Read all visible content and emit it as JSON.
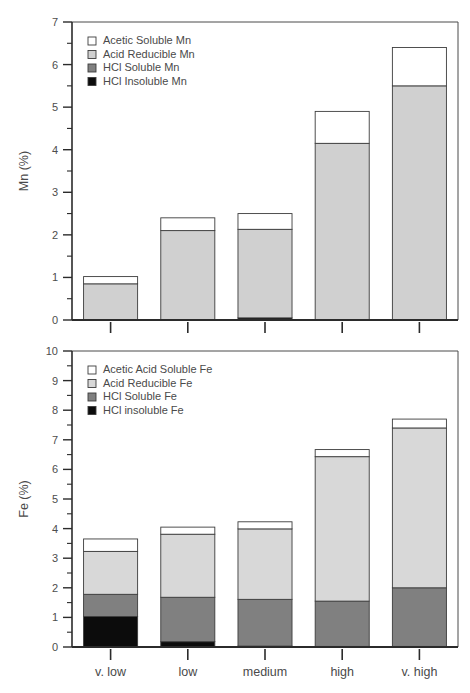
{
  "figure": {
    "background": "#ffffff",
    "categories": [
      "v. low",
      "low",
      "medium",
      "high",
      "v. high"
    ]
  },
  "colors": {
    "acetic": "#ffffff",
    "reducible_mn": "#d0d0d0",
    "reducible_fe": "#d8d8d8",
    "hcl_soluble": "#808080",
    "hcl_insoluble": "#0c0c0c",
    "outline": "#3c3c3c",
    "axis": "#2b2b2b",
    "text": "#4a4a4a"
  },
  "chart_data": [
    {
      "id": "mn-panel",
      "type": "bar",
      "stacked": true,
      "title": "",
      "xlabel": "",
      "ylabel": "Mn (%)",
      "ylim": [
        0,
        7
      ],
      "yticks": [
        0,
        1,
        2,
        3,
        4,
        5,
        6,
        7
      ],
      "ytick_labels": [
        "0",
        "1",
        "2",
        "3",
        "4",
        "5",
        "6",
        "7"
      ],
      "minor_tick_step": 0.5,
      "grid": false,
      "legend_position": "upper left",
      "categories": [
        "v. low",
        "low",
        "medium",
        "high",
        "v. high"
      ],
      "series": [
        {
          "name": "HCl Insoluble Mn",
          "key": "hcl_insoluble",
          "color": "#0c0c0c",
          "values": [
            0,
            0,
            0.05,
            0,
            0
          ]
        },
        {
          "name": "HCl Soluble Mn",
          "key": "hcl_soluble",
          "color": "#808080",
          "values": [
            0,
            0,
            0,
            0,
            0
          ]
        },
        {
          "name": "Acid Reducible Mn",
          "key": "reducible_mn",
          "color": "#d0d0d0",
          "values": [
            0.85,
            2.1,
            2.08,
            4.15,
            5.5
          ]
        },
        {
          "name": "Acetic Soluble Mn",
          "key": "acetic",
          "color": "#ffffff",
          "values": [
            0.17,
            0.3,
            0.37,
            0.75,
            0.9
          ]
        }
      ],
      "totals": [
        1.02,
        2.4,
        2.5,
        4.9,
        6.4
      ],
      "legend": [
        {
          "label": "Acetic Soluble Mn",
          "color": "#ffffff"
        },
        {
          "label": "Acid Reducible Mn",
          "color": "#d0d0d0"
        },
        {
          "label": "HCl Soluble Mn",
          "color": "#808080"
        },
        {
          "label": "HCl Insoluble Mn",
          "color": "#0c0c0c"
        }
      ]
    },
    {
      "id": "fe-panel",
      "type": "bar",
      "stacked": true,
      "title": "",
      "xlabel": "",
      "ylabel": "Fe (%)",
      "ylim": [
        0,
        10
      ],
      "yticks": [
        0,
        1,
        2,
        3,
        4,
        5,
        6,
        7,
        8,
        9,
        10
      ],
      "ytick_labels": [
        "0",
        "1",
        "2",
        "3",
        "4",
        "5",
        "6",
        "7",
        "8",
        "9",
        "10"
      ],
      "minor_tick_step": 0.5,
      "grid": false,
      "legend_position": "upper left",
      "categories": [
        "v. low",
        "low",
        "medium",
        "high",
        "v. high"
      ],
      "series": [
        {
          "name": "HCl insoluble Fe",
          "key": "hcl_insoluble",
          "color": "#0c0c0c",
          "values": [
            1.03,
            0.18,
            0.03,
            0.02,
            0.02
          ]
        },
        {
          "name": "HCl Soluble Fe",
          "key": "hcl_soluble",
          "color": "#808080",
          "values": [
            0.75,
            1.5,
            1.58,
            1.53,
            1.98
          ]
        },
        {
          "name": "Acid Reducible Fe",
          "key": "reducible_fe",
          "color": "#d8d8d8",
          "values": [
            1.45,
            2.13,
            2.38,
            4.88,
            5.4
          ]
        },
        {
          "name": "Acetic Acid Soluble Fe",
          "key": "acetic",
          "color": "#ffffff",
          "values": [
            0.42,
            0.24,
            0.24,
            0.24,
            0.3
          ]
        }
      ],
      "totals": [
        3.65,
        4.05,
        4.23,
        6.67,
        7.7
      ],
      "legend": [
        {
          "label": "Acetic Acid Soluble Fe",
          "color": "#ffffff"
        },
        {
          "label": "Acid Reducible Fe",
          "color": "#d8d8d8"
        },
        {
          "label": "HCl Soluble Fe",
          "color": "#808080"
        },
        {
          "label": "HCl insoluble Fe",
          "color": "#0c0c0c"
        }
      ]
    }
  ]
}
